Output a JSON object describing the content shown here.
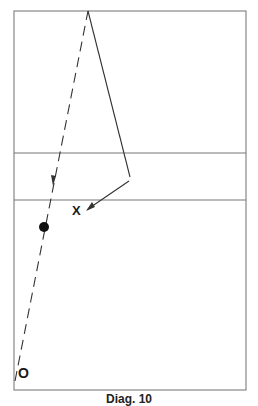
{
  "diagram": {
    "type": "court-play-diagram",
    "court": {
      "x": 14,
      "y": 11,
      "width": 232,
      "height": 379,
      "lines_y": [
        153,
        200
      ]
    },
    "players": [
      {
        "id": "o",
        "label": "O",
        "x": 24,
        "y": 374
      },
      {
        "id": "x",
        "label": "X",
        "x": 77,
        "y": 211
      },
      {
        "id": "ball",
        "shape": "dot",
        "x": 44,
        "y": 227
      }
    ],
    "paths": [
      {
        "style": "dashed",
        "from": [
          14,
          380
        ],
        "to": [
          88,
          11
        ]
      },
      {
        "style": "solid",
        "from": [
          88,
          11
        ],
        "to": [
          130,
          177
        ]
      },
      {
        "style": "solid-arrow",
        "from": [
          130,
          180
        ],
        "to": [
          86,
          211
        ]
      }
    ]
  },
  "labels": {
    "o": "O",
    "x": "X"
  },
  "caption": "Diag. 10"
}
